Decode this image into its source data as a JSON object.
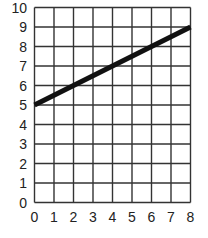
{
  "chart_data": {
    "type": "line",
    "title": "",
    "xlabel": "",
    "ylabel": "",
    "xlim": [
      0,
      8
    ],
    "ylim": [
      0,
      10
    ],
    "grid": true,
    "legend": null,
    "x_ticks": [
      "0",
      "1",
      "2",
      "3",
      "4",
      "5",
      "6",
      "7",
      "8"
    ],
    "y_ticks": [
      "0",
      "1",
      "2",
      "3",
      "4",
      "5",
      "6",
      "7",
      "8",
      "9",
      "10"
    ],
    "series": [
      {
        "name": "line",
        "x": [
          0,
          8
        ],
        "y": [
          5,
          9
        ],
        "color": "#111111"
      }
    ]
  },
  "colors": {
    "grid": "#333333",
    "line": "#111111",
    "text": "#222222",
    "background": "#ffffff"
  }
}
